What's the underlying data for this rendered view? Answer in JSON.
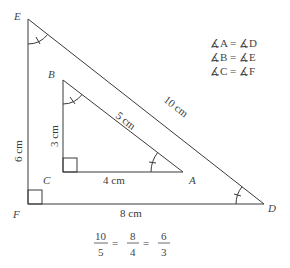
{
  "diagram": {
    "large_triangle": {
      "vertices": {
        "E": {
          "label": "E",
          "x": 28,
          "y": 19
        },
        "F": {
          "label": "F",
          "x": 28,
          "y": 204
        },
        "D": {
          "label": "D",
          "x": 264,
          "y": 204
        }
      },
      "sides": {
        "EF": "6 cm",
        "FD": "8 cm",
        "ED": "10 cm"
      }
    },
    "small_triangle": {
      "vertices": {
        "B": {
          "label": "B",
          "x": 63,
          "y": 80
        },
        "C": {
          "label": "C",
          "x": 63,
          "y": 172
        },
        "A": {
          "label": "A",
          "x": 183,
          "y": 172
        }
      },
      "sides": {
        "BC": "3 cm",
        "CA": "4 cm",
        "BA": "5 cm"
      }
    },
    "angle_equalities": [
      "∡A = ∡D",
      "∡B = ∡E",
      "∡C = ∡F"
    ],
    "ratio": {
      "fractions": [
        {
          "num": "10",
          "den": "5"
        },
        {
          "num": "8",
          "den": "4"
        },
        {
          "num": "6",
          "den": "3"
        }
      ],
      "operator": "="
    },
    "colors": {
      "line": "#3a3a3a",
      "text": "#444444",
      "background": "#ffffff"
    }
  }
}
